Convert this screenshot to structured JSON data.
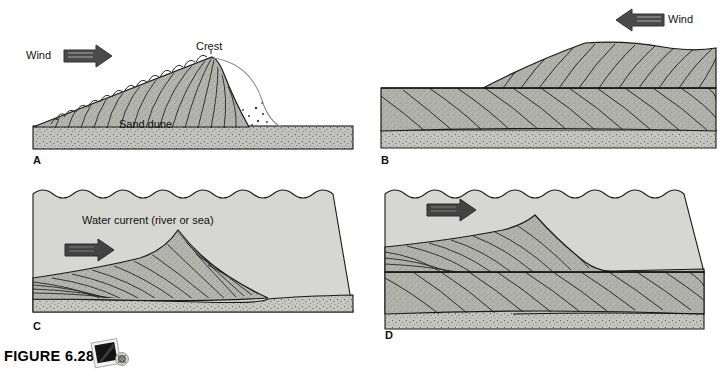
{
  "figure": {
    "caption_label": "FIGURE 6.28",
    "media_icon": "cd-rom-icon",
    "width": 726,
    "height": 371
  },
  "colors": {
    "water_fill": "#d5d5d3",
    "sand_fill": "#b9b9b5",
    "basement_fill": "#c3c3bf",
    "dune_fill": "#b3b3ae",
    "arrow_dark": "#4a4a4a",
    "arrow_inner": "#6e6e6e",
    "outline": "#1a1a1a",
    "page_background": "#ffffff",
    "text": "#111111"
  },
  "panels": [
    {
      "id": "A",
      "letter": "A",
      "title_semantic": "wind-dune-forming-cross-section",
      "labels": [
        {
          "name": "wind-label",
          "text": "Wind",
          "x": 26,
          "y": 50
        },
        {
          "name": "crest-label",
          "text": "Crest",
          "x": 198,
          "y": 42
        },
        {
          "name": "sand-dune-label",
          "text": "Sand dune",
          "x": 120,
          "y": 118
        }
      ],
      "arrow": {
        "name": "wind-arrow",
        "direction": "right",
        "style": "outlined",
        "x": 64,
        "y": 48,
        "w": 46,
        "h": 16
      },
      "features": [
        "saltation-hops",
        "slipface-eddy-curve",
        "grain-fall-dots",
        "cross-bed-laminae",
        "stippled-substrate"
      ]
    },
    {
      "id": "B",
      "letter": "B",
      "title_semantic": "wind-dune-buried-cross-bed-sets",
      "labels": [
        {
          "name": "wind-label",
          "text": "Wind",
          "x": 689,
          "y": 12
        }
      ],
      "arrow": {
        "name": "wind-arrow",
        "direction": "left",
        "style": "outlined",
        "x": 619,
        "y": 11,
        "w": 50,
        "h": 16
      },
      "features": [
        "upper-dune-set",
        "lower-cross-bed-set",
        "bounding-surface",
        "stippled-substrate"
      ]
    },
    {
      "id": "C",
      "letter": "C",
      "title_semantic": "water-current-ripple-cross-section",
      "labels": [
        {
          "name": "water-current-label",
          "text": "Water current (river or sea)",
          "x": 82,
          "y": 220
        }
      ],
      "arrow": {
        "name": "current-arrow",
        "direction": "right",
        "style": "solid",
        "x": 65,
        "y": 250,
        "w": 48,
        "h": 16
      },
      "features": [
        "wavy-water-surface",
        "foreset-laminae",
        "stippled-substrate"
      ]
    },
    {
      "id": "D",
      "letter": "D",
      "title_semantic": "water-current-stacked-cross-bed-sets",
      "labels": [],
      "arrow": {
        "name": "current-arrow",
        "direction": "right",
        "style": "solid",
        "x": 427,
        "y": 204,
        "w": 48,
        "h": 16
      },
      "features": [
        "wavy-water-surface",
        "upper-ripple-set",
        "lower-cross-bed-set",
        "bounding-surface",
        "stippled-substrate"
      ]
    }
  ]
}
